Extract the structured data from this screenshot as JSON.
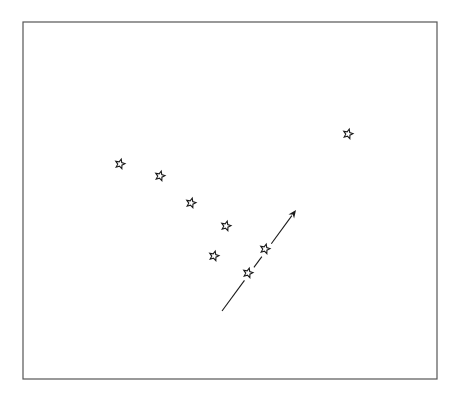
{
  "diagram": {
    "type": "star-field",
    "frame": {
      "x": 23,
      "y": 22,
      "width": 414,
      "height": 357,
      "stroke": "#555555"
    },
    "star_style": {
      "size": 9,
      "fill": "#ffffff",
      "stroke": "#1a1a1a"
    },
    "stars": [
      {
        "id": "star-1",
        "x": 120,
        "y": 164
      },
      {
        "id": "star-2",
        "x": 160,
        "y": 176
      },
      {
        "id": "star-3",
        "x": 191,
        "y": 203
      },
      {
        "id": "star-4",
        "x": 226,
        "y": 226
      },
      {
        "id": "star-5",
        "x": 214,
        "y": 256
      },
      {
        "id": "star-6",
        "x": 265,
        "y": 249
      },
      {
        "id": "star-7",
        "x": 248,
        "y": 273
      },
      {
        "id": "star-8",
        "x": 348,
        "y": 134
      }
    ],
    "arrow": {
      "from": {
        "x": 222,
        "y": 311
      },
      "to": {
        "x": 296,
        "y": 210
      },
      "color": "#1a1a1a",
      "gaps_at_stars": [
        "star-6",
        "star-7"
      ]
    }
  }
}
